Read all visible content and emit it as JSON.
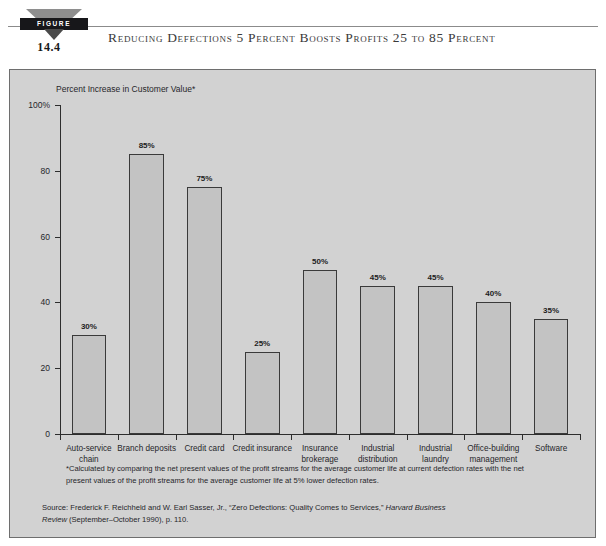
{
  "header": {
    "badge_label": "FIGURE",
    "figure_number": "14.4",
    "title": "Reducing Defections 5 Percent Boosts Profits 25 to 85 Percent"
  },
  "footnote": "*Calculated by comparing the net present values of the profit streams for the average customer life at current defection rates with the net present values of the profit streams for the average customer life at 5% lower defection rates.",
  "source": {
    "prefix": "Source: Frederick F. Reichheld and W. Earl Sasser, Jr., “Zero Defections: Quality Comes to Services,” ",
    "journal": "Harvard Business Review",
    "suffix": " (September–October 1990), p. 110."
  },
  "colors": {
    "panel_background": "#d2d2d2",
    "bar_fill": "#c3c3c3",
    "bar_stroke": "#3a3a3a",
    "axis": "#2d2d2d",
    "badge_dark": "#17171a",
    "badge_gray": "#8e8e8e"
  },
  "chart_data": {
    "type": "bar",
    "title": "Reducing Defections 5 Percent Boosts Profits 25 to 85 Percent",
    "xlabel": "",
    "ylabel": "Percent Increase in Customer Value*",
    "ylim": [
      0,
      100
    ],
    "yticks": [
      0,
      20,
      40,
      60,
      80,
      100
    ],
    "ytick_labels": [
      "0",
      "20",
      "40",
      "60",
      "80",
      "100%"
    ],
    "grid": false,
    "legend": false,
    "data_labels": [
      "30%",
      "85%",
      "75%",
      "25%",
      "50%",
      "45%",
      "45%",
      "40%",
      "35%"
    ],
    "categories": [
      "Auto-service chain",
      "Branch deposits",
      "Credit card",
      "Credit insurance",
      "Insurance brokerage",
      "Industrial distribution",
      "Industrial laundry",
      "Office-building management",
      "Software"
    ],
    "category_lines": [
      [
        "Auto-service",
        "chain"
      ],
      [
        "Branch deposits",
        ""
      ],
      [
        "Credit card",
        ""
      ],
      [
        "Credit insurance",
        ""
      ],
      [
        "Insurance",
        "brokerage"
      ],
      [
        "Industrial",
        "distribution"
      ],
      [
        "Industrial",
        "laundry"
      ],
      [
        "Office-building",
        "management"
      ],
      [
        "Software",
        ""
      ]
    ],
    "values": [
      30,
      85,
      75,
      25,
      50,
      45,
      45,
      40,
      35
    ]
  }
}
